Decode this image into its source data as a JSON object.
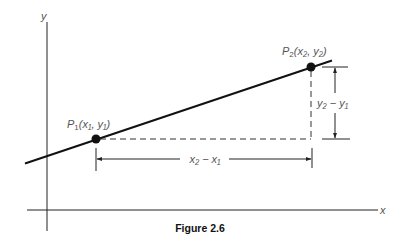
{
  "figure": {
    "caption": "Figure 2.6",
    "axes": {
      "x_label": "x",
      "y_label": "y"
    },
    "points": [
      {
        "name": "P1",
        "label_main": "P",
        "label_sub": "1",
        "label_coords": "(x₁, y₁)"
      },
      {
        "name": "P2",
        "label_main": "P",
        "label_sub": "2",
        "label_coords": "(x₂, y₂)"
      }
    ],
    "dimensions": {
      "horizontal": "x₂ − x₁",
      "vertical": "y₂ − y₁"
    },
    "colors": {
      "line": "#111111",
      "label": "#555555"
    }
  }
}
